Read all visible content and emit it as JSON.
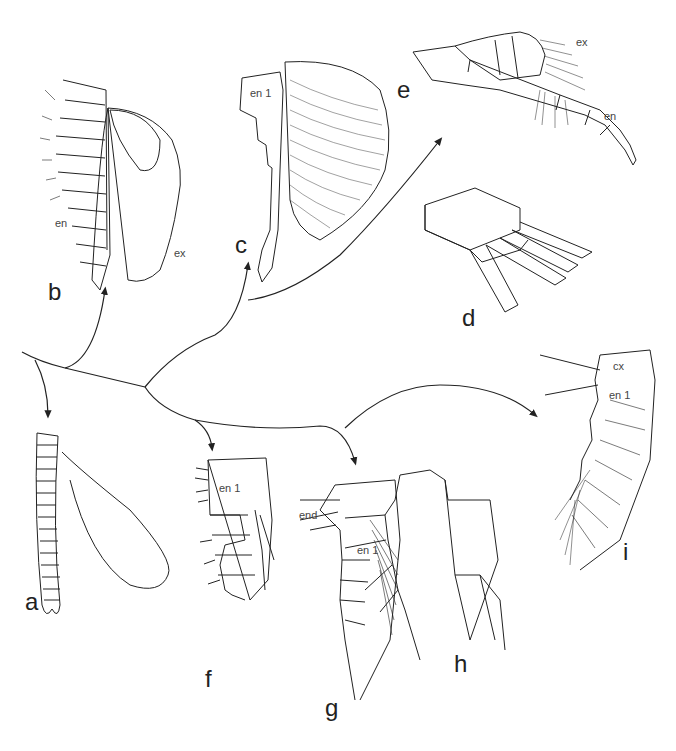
{
  "figure": {
    "panels": [
      {
        "id": "a",
        "label": "a",
        "parts": []
      },
      {
        "id": "b",
        "label": "b",
        "parts": [
          "en",
          "ex"
        ]
      },
      {
        "id": "c",
        "label": "c",
        "parts": [
          "en 1"
        ]
      },
      {
        "id": "d",
        "label": "d",
        "parts": []
      },
      {
        "id": "e",
        "label": "e",
        "parts": [
          "ex",
          "en"
        ]
      },
      {
        "id": "f",
        "label": "f",
        "parts": [
          "en 1"
        ]
      },
      {
        "id": "g",
        "label": "g",
        "parts": [
          "end",
          "en 1"
        ]
      },
      {
        "id": "h",
        "label": "h",
        "parts": []
      },
      {
        "id": "i",
        "label": "i",
        "parts": [
          "cx",
          "en 1"
        ]
      }
    ]
  },
  "labels": {
    "a": "a",
    "b": "b",
    "c": "c",
    "d": "d",
    "e": "e",
    "f": "f",
    "g": "g",
    "h": "h",
    "i": "i",
    "b_en": "en",
    "b_ex": "ex",
    "c_en1": "en 1",
    "e_ex": "ex",
    "e_en": "en",
    "f_en1": "en 1",
    "g_end": "end",
    "g_en1": "en 1",
    "i_cx": "cx",
    "i_en1": "en 1"
  },
  "colors": {
    "ink": "#222222",
    "background": "#ffffff"
  }
}
